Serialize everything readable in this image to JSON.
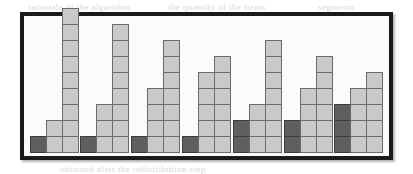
{
  "figure": {
    "caption": "",
    "background_color": "#fbfbfb",
    "border_color": "#1b1b1b",
    "light_block_color": "#c9c9c9",
    "dark_block_color": "#5f5f5f",
    "block_outline_color": "#6b6b6b"
  },
  "background_text": [
    {
      "text": "rationale of the algorithm",
      "x": 28,
      "y": 2
    },
    {
      "text": "the quantity of the items",
      "x": 168,
      "y": 2
    },
    {
      "text": "segments",
      "x": 318,
      "y": 2
    },
    {
      "text": "distribution for each of the",
      "x": 44,
      "y": 18
    },
    {
      "text": "partition sizes",
      "x": 196,
      "y": 18
    },
    {
      "text": "values of the counters are",
      "x": 36,
      "y": 34
    },
    {
      "text": "shown as columns",
      "x": 210,
      "y": 34
    },
    {
      "text": "each block",
      "x": 40,
      "y": 52
    },
    {
      "text": "represents one unit",
      "x": 172,
      "y": 52
    },
    {
      "text": "of measure",
      "x": 314,
      "y": 52
    },
    {
      "text": "the first column",
      "x": 60,
      "y": 70
    },
    {
      "text": "is highlighted in dark",
      "x": 186,
      "y": 70
    },
    {
      "text": "in all seven groups",
      "x": 36,
      "y": 86
    },
    {
      "text": "of the histogram",
      "x": 214,
      "y": 86
    },
    {
      "text": "the resulting shape",
      "x": 46,
      "y": 102
    },
    {
      "text": "illustrates the balance",
      "x": 206,
      "y": 102
    },
    {
      "text": "obtained after the redistribution step",
      "x": 60,
      "y": 164
    }
  ],
  "chart_data": {
    "type": "bar",
    "title": "",
    "subtitle": "",
    "xlabel": "",
    "ylabel": "",
    "grid": false,
    "legend": [],
    "unit_note": "Each square = 1 unit; dark squares are the highlighted (first/shaded) portion of a column.",
    "ylim": [
      0,
      9
    ],
    "categories": [
      "G1",
      "G2",
      "G3",
      "G4",
      "G5",
      "G6",
      "G7"
    ],
    "series": [
      {
        "name": "Column 1",
        "values": [
          1,
          1,
          1,
          1,
          2,
          2,
          3
        ]
      },
      {
        "name": "Column 2",
        "values": [
          2,
          3,
          4,
          5,
          3,
          4,
          4
        ]
      },
      {
        "name": "Column 3",
        "values": [
          9,
          8,
          7,
          6,
          7,
          6,
          5
        ]
      }
    ],
    "groups": [
      {
        "label": "G1",
        "columns": [
          {
            "total": 1,
            "dark": 1
          },
          {
            "total": 2,
            "dark": 0
          },
          {
            "total": 9,
            "dark": 0
          }
        ]
      },
      {
        "label": "G2",
        "columns": [
          {
            "total": 1,
            "dark": 1
          },
          {
            "total": 3,
            "dark": 0
          },
          {
            "total": 8,
            "dark": 0
          }
        ]
      },
      {
        "label": "G3",
        "columns": [
          {
            "total": 1,
            "dark": 1
          },
          {
            "total": 4,
            "dark": 0
          },
          {
            "total": 7,
            "dark": 0
          }
        ]
      },
      {
        "label": "G4",
        "columns": [
          {
            "total": 1,
            "dark": 1
          },
          {
            "total": 5,
            "dark": 0
          },
          {
            "total": 6,
            "dark": 0
          }
        ]
      },
      {
        "label": "G5",
        "columns": [
          {
            "total": 2,
            "dark": 2
          },
          {
            "total": 3,
            "dark": 0
          },
          {
            "total": 7,
            "dark": 0
          }
        ]
      },
      {
        "label": "G6",
        "columns": [
          {
            "total": 2,
            "dark": 2
          },
          {
            "total": 4,
            "dark": 0
          },
          {
            "total": 6,
            "dark": 0
          }
        ]
      },
      {
        "label": "G7",
        "columns": [
          {
            "total": 3,
            "dark": 3
          },
          {
            "total": 4,
            "dark": 0
          },
          {
            "total": 5,
            "dark": 0
          }
        ]
      }
    ]
  }
}
